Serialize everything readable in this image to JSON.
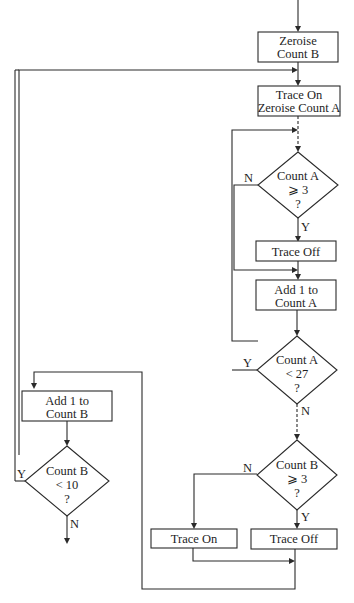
{
  "flowchart": {
    "nodes": {
      "zeroise_b": {
        "line1": "Zeroise",
        "line2": "Count B"
      },
      "trace_on_zeroise_a": {
        "line1": "Trace On",
        "line2": "Zeroise Count A"
      },
      "dec_a_ge3": {
        "line1": "Count A",
        "line2": "⩾ 3",
        "line3": "?"
      },
      "trace_off_1": {
        "line1": "Trace Off"
      },
      "add1_a": {
        "line1": "Add 1 to",
        "line2": "Count A"
      },
      "dec_a_lt27": {
        "line1": "Count A",
        "line2": "< 27",
        "line3": "?"
      },
      "dec_b_ge3": {
        "line1": "Count B",
        "line2": "⩾ 3",
        "line3": "?"
      },
      "trace_on_2": {
        "line1": "Trace On"
      },
      "trace_off_2": {
        "line1": "Trace Off"
      },
      "add1_b": {
        "line1": "Add 1 to",
        "line2": "Count B"
      },
      "dec_b_lt10": {
        "line1": "Count B",
        "line2": "< 10",
        "line3": "?"
      }
    },
    "labels": {
      "a_ge3_no": "N",
      "a_ge3_yes": "Y",
      "a_lt27_yes": "Y",
      "a_lt27_no": "N",
      "b_ge3_no": "N",
      "b_ge3_yes": "Y",
      "b_lt10_yes": "Y",
      "b_lt10_no": "N"
    }
  }
}
